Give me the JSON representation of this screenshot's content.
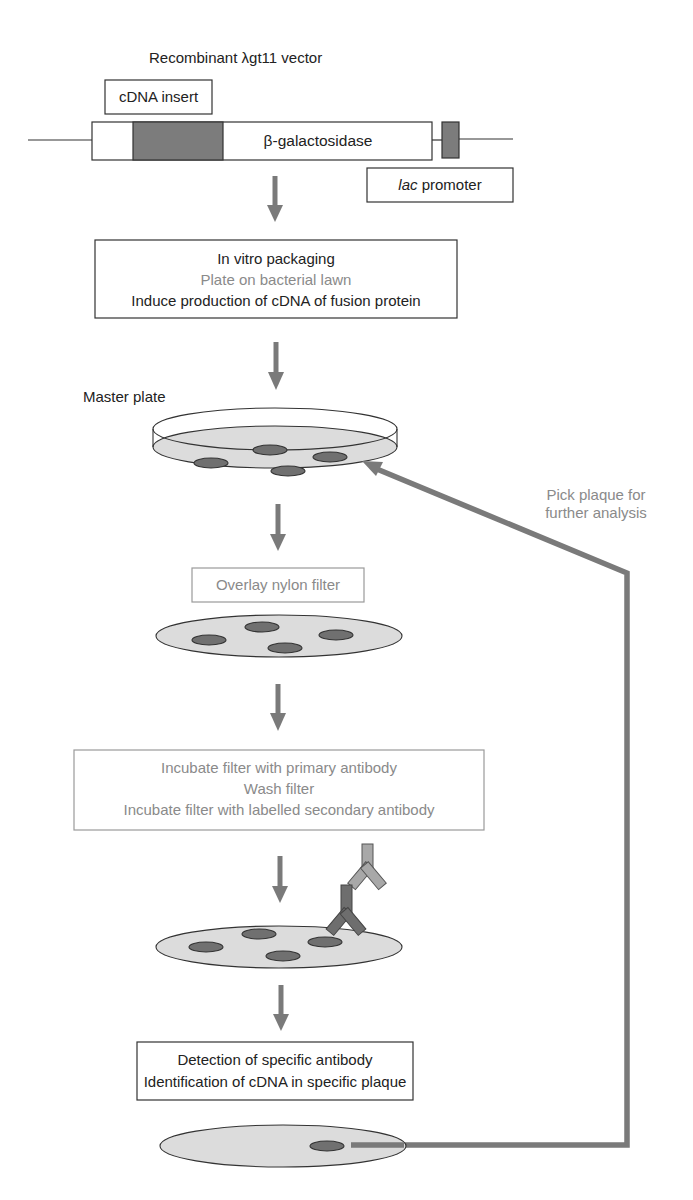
{
  "title": "Recombinant λgt11 vector",
  "vector": {
    "cdna_insert_label": "cDNA insert",
    "gene_label": "β-galactosidase",
    "promoter_label_italic": "lac",
    "promoter_label_rest": " promoter"
  },
  "steps": {
    "packaging": {
      "line1": "In vitro packaging",
      "line2": "Plate on bacterial lawn",
      "line3": "Induce production of cDNA of fusion protein"
    },
    "master_plate_label": "Master plate",
    "overlay": "Overlay nylon filter",
    "incubate": {
      "line1": "Incubate filter with primary antibody",
      "line2": "Wash filter",
      "line3": "Incubate filter with labelled secondary antibody"
    },
    "detection": {
      "line1": "Detection of specific antibody",
      "line2": "Identification of cDNA in specific plaque"
    }
  },
  "feedback": {
    "line1": "Pick plaque for",
    "line2": "further analysis"
  },
  "colors": {
    "arrow": "#7a7a7a",
    "dish_fill": "#dcdcdc",
    "plaque_fill": "#707070",
    "grey_text": "#8a8a8a",
    "dark_text": "#222222"
  }
}
